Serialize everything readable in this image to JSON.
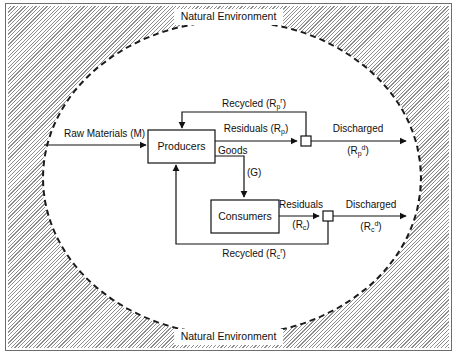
{
  "figure": {
    "environment_label_top": "Natural Environment",
    "environment_label_bottom": "Natural Environment",
    "boundary_shape": "ellipse-dashed",
    "background_pattern": "diagonal-hatch"
  },
  "colors": {
    "ink": "#111111",
    "hatch": "#8e8e8e",
    "paper": "#ffffff",
    "frame": "#6d6d6d"
  },
  "nodes": {
    "producers": "Producers",
    "consumers": "Consumers",
    "junction_producer": "",
    "junction_consumer": ""
  },
  "flows": {
    "raw_materials": "Raw Materials (M)",
    "goods_name": "Goods",
    "goods_symbol": "(G)",
    "producer_residuals_name": "Residuals (R",
    "producer_residuals_sub": "p",
    "producer_residuals_close": ")",
    "producer_recycled_name": "Recycled (R",
    "producer_recycled_sub": "p",
    "producer_recycled_sup": "r",
    "producer_recycled_close": ")",
    "producer_discharged_name": "Discharged",
    "producer_discharged_open": "(R",
    "producer_discharged_sub": "p",
    "producer_discharged_sup": "d",
    "producer_discharged_close": ")",
    "consumer_residuals_name": "Residuals",
    "consumer_residuals_open": "(R",
    "consumer_residuals_sub": "c",
    "consumer_residuals_close": ")",
    "consumer_recycled_name": "Recycled (R",
    "consumer_recycled_sub": "c",
    "consumer_recycled_sup": "r",
    "consumer_recycled_close": ")",
    "consumer_discharged_name": "Discharged",
    "consumer_discharged_open": "(R",
    "consumer_discharged_sub": "c",
    "consumer_discharged_sup": "d",
    "consumer_discharged_close": ")"
  }
}
